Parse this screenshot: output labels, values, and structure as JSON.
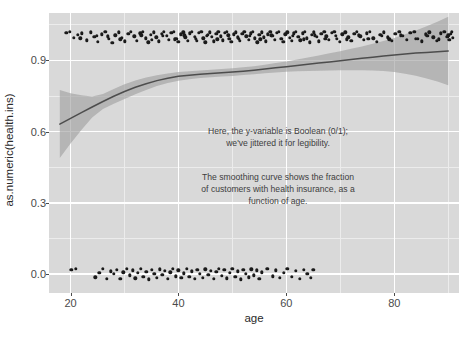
{
  "chart_data": {
    "type": "scatter",
    "title": "",
    "xlabel": "age",
    "ylabel": "as.numeric(health.ins)",
    "xlim": [
      16,
      92
    ],
    "ylim": [
      -0.08,
      1.1
    ],
    "x_ticks": [
      20,
      40,
      60,
      80
    ],
    "y_ticks": [
      "0.0",
      "0.3",
      "0.6",
      "0.9"
    ],
    "y_tick_values": [
      0.0,
      0.3,
      0.6,
      0.9
    ],
    "x_minor_ticks": [
      30,
      50,
      70,
      90
    ],
    "y_minor_ticks": [
      0.15,
      0.45,
      0.75,
      1.05
    ],
    "grid": true,
    "legend": "none",
    "panel_background": "#d9d9d9",
    "grid_color": "#ffffff",
    "point_color": "#1a1a1a",
    "curve_color": "#4d4d4d",
    "ribbon_color": "#9e9e9e",
    "annotations": [
      {
        "id": "boolean-note",
        "text": "Here, the y-variable is Boolean (0/1);\nwe've jittered it for legibility.",
        "x": 46,
        "y": 0.46
      },
      {
        "id": "smoothing-note",
        "text": "The smoothing curve shows the fraction\nof customers with health insurance, as a\nfunction of age.",
        "x": 46,
        "y": 0.26
      }
    ],
    "smooth_curve": {
      "name": "loess fit: fraction with health insurance",
      "x": [
        18,
        20,
        22,
        24,
        26,
        28,
        30,
        32,
        34,
        36,
        38,
        40,
        42,
        44,
        46,
        48,
        50,
        52,
        54,
        56,
        58,
        60,
        62,
        64,
        66,
        68,
        70,
        72,
        74,
        76,
        78,
        80,
        82,
        84,
        86,
        88,
        90
      ],
      "y": [
        0.632,
        0.656,
        0.68,
        0.704,
        0.727,
        0.749,
        0.769,
        0.787,
        0.802,
        0.815,
        0.825,
        0.833,
        0.838,
        0.842,
        0.845,
        0.848,
        0.851,
        0.855,
        0.859,
        0.864,
        0.869,
        0.874,
        0.879,
        0.884,
        0.889,
        0.894,
        0.899,
        0.904,
        0.909,
        0.914,
        0.919,
        0.923,
        0.927,
        0.931,
        0.934,
        0.937,
        0.94
      ],
      "ci_upper": [
        0.775,
        0.762,
        0.753,
        0.748,
        0.759,
        0.78,
        0.8,
        0.816,
        0.828,
        0.838,
        0.845,
        0.851,
        0.855,
        0.858,
        0.861,
        0.864,
        0.867,
        0.871,
        0.876,
        0.882,
        0.889,
        0.896,
        0.904,
        0.912,
        0.921,
        0.93,
        0.939,
        0.949,
        0.959,
        0.97,
        0.982,
        0.995,
        1.01,
        1.026,
        1.044,
        1.063,
        1.084
      ],
      "ci_lower": [
        0.489,
        0.55,
        0.607,
        0.66,
        0.695,
        0.718,
        0.738,
        0.758,
        0.776,
        0.792,
        0.805,
        0.815,
        0.821,
        0.826,
        0.829,
        0.832,
        0.835,
        0.839,
        0.842,
        0.846,
        0.849,
        0.852,
        0.854,
        0.856,
        0.857,
        0.858,
        0.859,
        0.859,
        0.859,
        0.858,
        0.856,
        0.851,
        0.844,
        0.836,
        0.824,
        0.811,
        0.796
      ]
    },
    "points_y1_note": "jittered around y = 1 (has health insurance)",
    "points_y0_note": "jittered around y = 0 (no health insurance)",
    "points_y1": [
      [
        19.2,
        1.017
      ],
      [
        19.9,
        1.021
      ],
      [
        20.6,
        0.995
      ],
      [
        21.3,
        1.008
      ],
      [
        22.1,
        1.014
      ],
      [
        23.0,
        0.985
      ],
      [
        23.8,
        1.018
      ],
      [
        24.4,
        0.999
      ],
      [
        25.1,
        0.978
      ],
      [
        25.8,
        1.011
      ],
      [
        26.4,
        1.021
      ],
      [
        27.1,
        0.99
      ],
      [
        27.7,
        0.974
      ],
      [
        28.3,
        1.006
      ],
      [
        28.9,
        1.019
      ],
      [
        29.5,
        0.996
      ],
      [
        30.1,
        0.98
      ],
      [
        30.7,
        1.012
      ],
      [
        31.2,
        1.022
      ],
      [
        31.8,
        1.001
      ],
      [
        32.3,
        0.983
      ],
      [
        32.9,
        1.015
      ],
      [
        33.4,
        1.02
      ],
      [
        33.9,
        0.994
      ],
      [
        34.4,
        0.977
      ],
      [
        34.9,
        1.009
      ],
      [
        35.4,
        1.018
      ],
      [
        35.9,
        0.998
      ],
      [
        36.4,
        0.981
      ],
      [
        36.9,
        1.013
      ],
      [
        37.3,
        1.021
      ],
      [
        37.8,
        1.003
      ],
      [
        38.2,
        0.986
      ],
      [
        38.7,
        1.016
      ],
      [
        39.1,
        1.022
      ],
      [
        39.6,
        0.992
      ],
      [
        40.0,
        0.979
      ],
      [
        40.4,
        1.01
      ],
      [
        40.9,
        1.019
      ],
      [
        41.3,
        0.997
      ],
      [
        41.7,
        0.982
      ],
      [
        42.1,
        1.014
      ],
      [
        42.5,
        1.021
      ],
      [
        43.0,
        1.0
      ],
      [
        43.4,
        0.984
      ],
      [
        43.8,
        1.017
      ],
      [
        44.2,
        1.022
      ],
      [
        44.6,
        0.993
      ],
      [
        45.0,
        0.976
      ],
      [
        45.4,
        1.008
      ],
      [
        45.8,
        1.018
      ],
      [
        46.2,
        0.999
      ],
      [
        46.6,
        0.98
      ],
      [
        47.0,
        1.012
      ],
      [
        47.4,
        1.021
      ],
      [
        47.8,
        1.002
      ],
      [
        48.2,
        0.985
      ],
      [
        48.6,
        1.016
      ],
      [
        49.0,
        1.022
      ],
      [
        49.4,
        0.991
      ],
      [
        49.8,
        0.978
      ],
      [
        50.2,
        1.01
      ],
      [
        50.6,
        1.019
      ],
      [
        51.0,
        0.997
      ],
      [
        51.4,
        0.983
      ],
      [
        51.8,
        1.013
      ],
      [
        52.2,
        1.021
      ],
      [
        52.6,
        1.001
      ],
      [
        53.0,
        0.986
      ],
      [
        53.4,
        1.015
      ],
      [
        53.8,
        1.022
      ],
      [
        54.2,
        0.994
      ],
      [
        54.6,
        0.977
      ],
      [
        55.0,
        1.009
      ],
      [
        55.4,
        1.018
      ],
      [
        55.8,
        0.998
      ],
      [
        56.2,
        0.981
      ],
      [
        56.6,
        1.011
      ],
      [
        57.0,
        1.02
      ],
      [
        57.4,
        1.003
      ],
      [
        57.8,
        0.987
      ],
      [
        58.2,
        1.016
      ],
      [
        58.6,
        1.021
      ],
      [
        59.0,
        0.992
      ],
      [
        59.4,
        0.979
      ],
      [
        59.8,
        1.01
      ],
      [
        60.2,
        1.019
      ],
      [
        60.6,
        0.996
      ],
      [
        61.0,
        0.982
      ],
      [
        61.4,
        1.014
      ],
      [
        61.8,
        1.022
      ],
      [
        62.2,
        1.0
      ],
      [
        62.6,
        0.985
      ],
      [
        63.0,
        1.015
      ],
      [
        63.4,
        1.02
      ],
      [
        63.8,
        0.993
      ],
      [
        64.3,
        0.976
      ],
      [
        64.7,
        1.008
      ],
      [
        65.1,
        1.018
      ],
      [
        65.6,
        0.999
      ],
      [
        66.0,
        0.98
      ],
      [
        66.5,
        1.012
      ],
      [
        67.0,
        1.021
      ],
      [
        67.4,
        1.002
      ],
      [
        67.9,
        0.986
      ],
      [
        68.4,
        1.016
      ],
      [
        68.9,
        1.022
      ],
      [
        69.4,
        0.991
      ],
      [
        69.9,
        0.978
      ],
      [
        70.4,
        1.011
      ],
      [
        70.9,
        1.019
      ],
      [
        71.5,
        0.997
      ],
      [
        72.0,
        0.983
      ],
      [
        72.6,
        1.013
      ],
      [
        73.1,
        1.021
      ],
      [
        73.7,
        1.001
      ],
      [
        74.3,
        0.987
      ],
      [
        74.9,
        1.015
      ],
      [
        75.5,
        1.02
      ],
      [
        76.1,
        0.994
      ],
      [
        76.8,
        0.979
      ],
      [
        77.4,
        1.009
      ],
      [
        78.1,
        1.018
      ],
      [
        78.8,
        0.998
      ],
      [
        79.5,
        0.982
      ],
      [
        80.2,
        1.012
      ],
      [
        80.9,
        1.021
      ],
      [
        81.6,
        1.003
      ],
      [
        82.3,
        0.986
      ],
      [
        83.0,
        1.016
      ],
      [
        83.7,
        1.022
      ],
      [
        84.4,
        0.992
      ],
      [
        85.1,
        0.98
      ],
      [
        85.8,
        1.01
      ],
      [
        86.5,
        1.019
      ],
      [
        87.2,
        0.997
      ],
      [
        87.9,
        0.984
      ],
      [
        88.6,
        1.014
      ],
      [
        89.3,
        1.021
      ],
      [
        89.8,
        0.999
      ],
      [
        90.2,
        0.988
      ],
      [
        90.5,
        1.013
      ],
      [
        90.7,
        1.02
      ],
      [
        90.9,
        0.995
      ],
      [
        21.8,
        0.993
      ],
      [
        24.9,
        1.005
      ],
      [
        26.9,
        1.002
      ],
      [
        29.2,
        0.989
      ],
      [
        33.1,
        1.006
      ],
      [
        35.1,
        0.988
      ],
      [
        37.1,
        1.005
      ],
      [
        39.3,
        0.989
      ],
      [
        41.1,
        1.006
      ],
      [
        43.2,
        0.99
      ],
      [
        45.2,
        1.005
      ],
      [
        47.2,
        0.989
      ],
      [
        49.2,
        1.006
      ],
      [
        51.2,
        0.99
      ],
      [
        53.2,
        1.004
      ],
      [
        55.2,
        0.989
      ],
      [
        57.2,
        1.006
      ],
      [
        59.2,
        0.99
      ],
      [
        61.2,
        1.005
      ],
      [
        63.2,
        0.989
      ],
      [
        65.3,
        1.006
      ],
      [
        67.2,
        0.99
      ],
      [
        69.2,
        1.004
      ],
      [
        71.2,
        0.989
      ],
      [
        73.4,
        1.006
      ],
      [
        75.2,
        0.99
      ],
      [
        77.7,
        1.005
      ],
      [
        79.1,
        0.989
      ],
      [
        81.2,
        1.006
      ],
      [
        84.0,
        0.99
      ],
      [
        86.1,
        1.004
      ],
      [
        88.2,
        0.989
      ],
      [
        90.0,
        1.006
      ]
    ],
    "points_y0": [
      [
        20.1,
        0.018
      ],
      [
        21.0,
        0.022
      ],
      [
        24.6,
        -0.014
      ],
      [
        25.3,
        0.006
      ],
      [
        26.0,
        0.021
      ],
      [
        26.7,
        -0.019
      ],
      [
        27.4,
        0.012
      ],
      [
        28.0,
        0.0
      ],
      [
        28.6,
        0.019
      ],
      [
        29.2,
        -0.021
      ],
      [
        29.8,
        0.008
      ],
      [
        30.4,
        0.022
      ],
      [
        31.0,
        -0.006
      ],
      [
        31.5,
        0.015
      ],
      [
        32.0,
        -0.018
      ],
      [
        32.5,
        0.004
      ],
      [
        33.0,
        0.021
      ],
      [
        33.5,
        -0.012
      ],
      [
        34.0,
        0.01
      ],
      [
        34.5,
        -0.022
      ],
      [
        35.0,
        0.017
      ],
      [
        35.5,
        0.001
      ],
      [
        36.0,
        -0.016
      ],
      [
        36.5,
        0.02
      ],
      [
        37.0,
        -0.004
      ],
      [
        37.5,
        0.013
      ],
      [
        38.0,
        -0.02
      ],
      [
        38.5,
        0.007
      ],
      [
        39.0,
        0.022
      ],
      [
        39.5,
        -0.009
      ],
      [
        40.0,
        0.016
      ],
      [
        40.5,
        -0.017
      ],
      [
        41.0,
        0.003
      ],
      [
        41.5,
        0.021
      ],
      [
        42.0,
        -0.013
      ],
      [
        42.5,
        0.011
      ],
      [
        43.0,
        -0.021
      ],
      [
        43.5,
        0.018
      ],
      [
        44.0,
        0.002
      ],
      [
        44.5,
        -0.015
      ],
      [
        45.0,
        0.02
      ],
      [
        45.5,
        -0.003
      ],
      [
        46.0,
        0.014
      ],
      [
        46.5,
        -0.019
      ],
      [
        47.0,
        0.009
      ],
      [
        47.5,
        0.022
      ],
      [
        48.0,
        -0.008
      ],
      [
        48.5,
        0.017
      ],
      [
        49.0,
        -0.018
      ],
      [
        49.5,
        0.005
      ],
      [
        50.0,
        0.021
      ],
      [
        50.5,
        -0.011
      ],
      [
        51.0,
        0.012
      ],
      [
        51.5,
        -0.022
      ],
      [
        52.0,
        0.019
      ],
      [
        52.5,
        0.0
      ],
      [
        53.0,
        -0.014
      ],
      [
        53.5,
        0.02
      ],
      [
        54.0,
        -0.005
      ],
      [
        54.5,
        0.015
      ],
      [
        55.0,
        -0.02
      ],
      [
        55.5,
        0.008
      ],
      [
        56.5,
        0.021
      ],
      [
        57.5,
        -0.01
      ],
      [
        58.0,
        0.016
      ],
      [
        58.8,
        -0.016
      ],
      [
        59.5,
        0.004
      ],
      [
        60.2,
        0.021
      ],
      [
        61.0,
        -0.012
      ],
      [
        61.8,
        0.013
      ],
      [
        62.5,
        -0.021
      ],
      [
        63.2,
        0.018
      ],
      [
        63.9,
        0.001
      ],
      [
        64.5,
        -0.015
      ],
      [
        65.0,
        0.019
      ]
    ]
  },
  "axes": {
    "y_title": "as.numeric(health.ins)",
    "x_title": "age"
  }
}
